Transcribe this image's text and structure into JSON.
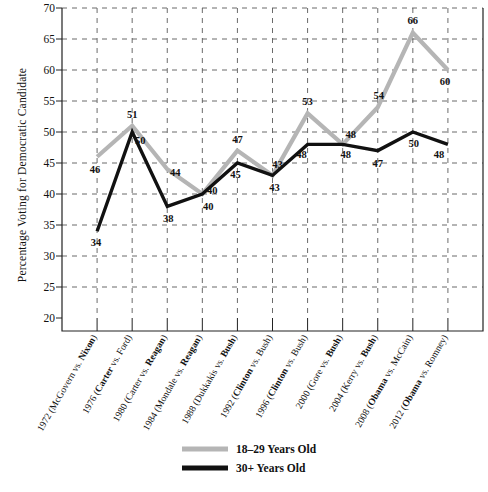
{
  "chart_data": {
    "type": "line",
    "title": "",
    "xlabel": "",
    "ylabel": "Percentage Voting for Democratic Candidate",
    "ylim": [
      20,
      70
    ],
    "yticks": [
      20,
      25,
      30,
      35,
      40,
      45,
      50,
      55,
      60,
      65,
      70
    ],
    "grid": true,
    "grid_style": "dashed",
    "legend_position": "bottom-center",
    "categories": [
      "1972 (McGovern vs. Nixon)",
      "1976 (Carter vs. Ford)",
      "1980 (Carter vs. Reagan)",
      "1984 (Mondale vs. Reagan)",
      "1988 (Dukkakis vs. Bush)",
      "1992 (Clinton vs. Bush)",
      "1996 (Clinton vs. Bush)",
      "2000 (Gore vs. Bush)",
      "2004 (Kerry vs. Bush)",
      "2008 (Obama vs. McCain)",
      "2012 (Obama vs. Romney)"
    ],
    "category_parts": [
      {
        "pre": "1972 (McGovern vs. ",
        "win": "Nixon",
        "post": ")"
      },
      {
        "pre": "1976 (",
        "win": "Carter",
        "post": " vs. Ford)"
      },
      {
        "pre": "1980 (Carter vs. ",
        "win": "Reagan",
        "post": ")"
      },
      {
        "pre": "1984 (Mondale vs. ",
        "win": "Reagan",
        "post": ")"
      },
      {
        "pre": "1988 (Dukkakis vs. ",
        "win": "Bush",
        "post": ")"
      },
      {
        "pre": "1992 (",
        "win": "Clinton",
        "post": " vs. Bush)"
      },
      {
        "pre": "1996 (",
        "win": "Clinton",
        "post": " vs. Bush)"
      },
      {
        "pre": "2000 (Gore vs. ",
        "win": "Bush",
        "post": ")"
      },
      {
        "pre": "2004 (Kerry vs. ",
        "win": "Bush",
        "post": ")"
      },
      {
        "pre": "2008 (",
        "win": "Obama",
        "post": " vs. McCain)"
      },
      {
        "pre": "2012 (",
        "win": "Obama",
        "post": " vs. Romney)"
      }
    ],
    "series": [
      {
        "name": "18–29 Years Old",
        "color": "#b5b5b5",
        "values": [
          46,
          51,
          44,
          40,
          47,
          43,
          53,
          48,
          54,
          66,
          60
        ],
        "label_offsets": [
          {
            "dx": -2,
            "dy": 16
          },
          {
            "dx": 0,
            "dy": -8
          },
          {
            "dx": 8,
            "dy": 7
          },
          {
            "dx": 10,
            "dy": 0
          },
          {
            "dx": 0,
            "dy": -8
          },
          {
            "dx": 5,
            "dy": -7
          },
          {
            "dx": 0,
            "dy": -8
          },
          {
            "dx": 8,
            "dy": -6
          },
          {
            "dx": 1,
            "dy": -8
          },
          {
            "dx": 0,
            "dy": -9
          },
          {
            "dx": -3,
            "dy": 15
          }
        ]
      },
      {
        "name": "30+ Years Old",
        "color": "#111111",
        "values": [
          34,
          50,
          38,
          40,
          45,
          43,
          48,
          48,
          47,
          50,
          48
        ],
        "label_offsets": [
          {
            "dx": -1,
            "dy": 15
          },
          {
            "dx": 8,
            "dy": 12
          },
          {
            "dx": 1,
            "dy": 16
          },
          {
            "dx": 6,
            "dy": 16
          },
          {
            "dx": -2,
            "dy": 15
          },
          {
            "dx": 2,
            "dy": 16
          },
          {
            "dx": -6,
            "dy": 14
          },
          {
            "dx": 3,
            "dy": 14
          },
          {
            "dx": 0,
            "dy": 16
          },
          {
            "dx": 1,
            "dy": 15
          },
          {
            "dx": -9,
            "dy": 14
          }
        ]
      }
    ]
  },
  "legend": {
    "items": [
      {
        "label": "18–29 Years Old",
        "color": "#b5b5b5"
      },
      {
        "label": "30+ Years Old",
        "color": "#111111"
      }
    ]
  }
}
